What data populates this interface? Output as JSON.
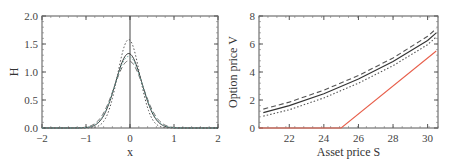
{
  "chart_data": [
    {
      "type": "line",
      "title": "",
      "xlabel": "x",
      "ylabel": "H",
      "xlim": [
        -2,
        2
      ],
      "ylim": [
        0.0,
        2.0
      ],
      "xticks": [
        "−2",
        "−1",
        "0",
        "1",
        "2"
      ],
      "yticks": [
        "0.0",
        "0.5",
        "1.0",
        "1.5",
        "2.0"
      ],
      "grid": false,
      "vertical_line_at_x": 0,
      "series": [
        {
          "name": "solid",
          "style": "solid",
          "color": "#333333",
          "center": -0.03,
          "peak": 1.33,
          "sigma": 0.3
        },
        {
          "name": "dotted",
          "style": "dotted",
          "color": "#555555",
          "center": -0.03,
          "peak": 1.58,
          "sigma": 0.25
        },
        {
          "name": "dashed",
          "style": "dashed",
          "color": "#666666",
          "center": -0.03,
          "peak": 1.2,
          "sigma": 0.33
        },
        {
          "name": "teal-markers",
          "style": "dotted",
          "color": "#6aa8a0",
          "center": -0.03,
          "peak": 1.28,
          "sigma": 0.31
        }
      ]
    },
    {
      "type": "line",
      "title": "",
      "xlabel": "Asset price S",
      "ylabel": "Option price V",
      "xlim": [
        20.25,
        30.6
      ],
      "ylim": [
        0,
        8
      ],
      "xticks": [
        "22",
        "24",
        "26",
        "28",
        "30"
      ],
      "yticks": [
        "0",
        "2",
        "4",
        "6",
        "8"
      ],
      "grid": false,
      "x": [
        20.5,
        22,
        24,
        26,
        28,
        30,
        30.5
      ],
      "series": [
        {
          "name": "dashed",
          "style": "dashed",
          "color": "#555555",
          "values": [
            1.35,
            1.85,
            2.7,
            3.75,
            5.0,
            6.55,
            7.1
          ]
        },
        {
          "name": "solid",
          "style": "solid",
          "color": "#333333",
          "values": [
            1.1,
            1.6,
            2.45,
            3.5,
            4.75,
            6.25,
            6.8
          ]
        },
        {
          "name": "dotted",
          "style": "dotted",
          "color": "#555555",
          "values": [
            0.85,
            1.3,
            2.15,
            3.2,
            4.45,
            5.95,
            6.5
          ]
        },
        {
          "name": "payoff",
          "style": "solid",
          "color": "#e8604c",
          "values": [
            0,
            0,
            0,
            1,
            3,
            5,
            5.5
          ],
          "kink_at": 25
        }
      ]
    }
  ]
}
